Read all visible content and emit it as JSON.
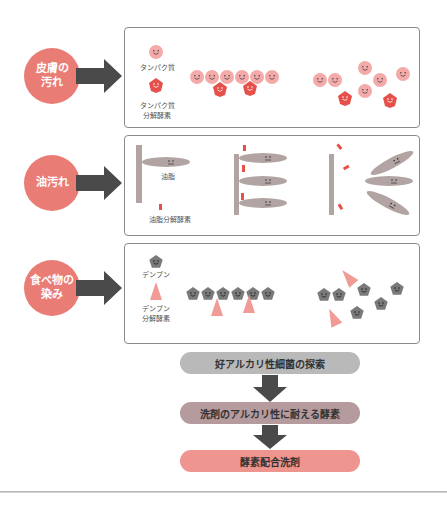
{
  "colors": {
    "circle": "#ea7c76",
    "arrow": "#4a4a4a",
    "protein": "#f3aaa8",
    "protease": "#e5504a",
    "fat": "#b3a4a4",
    "lipase": "#e5504a",
    "starch": "#7a7a7a",
    "amylase": "#f19b96",
    "pill1": "#b9b9b9",
    "pill2": "#b59a9e",
    "pill3": "#ef9590"
  },
  "rows": [
    {
      "id": "skin",
      "circle_label": "皮膚の\n汚れ",
      "legend": {
        "substrate_label": "タンパク質",
        "enzyme_label": "タンパク質\n分解酵素"
      },
      "substrate_icon": "smiling-circle-icon",
      "enzyme_icon": "smiling-diamond-icon"
    },
    {
      "id": "oil",
      "circle_label": "油汚れ",
      "legend": {
        "substrate_label": "油脂",
        "enzyme_label": "油脂分解酵素"
      },
      "substrate_icon": "ellipse-face-icon",
      "enzyme_icon": "red-bar-icon"
    },
    {
      "id": "food",
      "circle_label": "食べ物の\n染み",
      "legend": {
        "substrate_label": "デンプン",
        "enzyme_label": "デンプン\n分解酵素"
      },
      "substrate_icon": "pentagon-face-icon",
      "enzyme_icon": "triangle-icon"
    }
  ],
  "flow": [
    {
      "label": "好アルカリ性細菌の探索"
    },
    {
      "label": "洗剤のアルカリ性に耐える酵素"
    },
    {
      "label": "酵素配合洗剤"
    }
  ]
}
